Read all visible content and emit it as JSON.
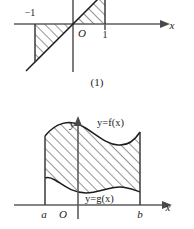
{
  "document": {
    "type": "math-figure-panel",
    "background_color": "#ffffff",
    "ink_color": "#1a1a1a"
  },
  "figures": [
    {
      "id": "figure-1",
      "caption": "(1)",
      "description": "Line y=x with two hatched triangular regions between the line and the x-axis",
      "axes": {
        "x_label": "x",
        "y_label": "",
        "origin_label": "O"
      },
      "tick_labels": [
        {
          "name": "neg-one",
          "text": "−1"
        },
        {
          "name": "one",
          "text": "1"
        }
      ],
      "regions": [
        {
          "name": "left-region",
          "hatched": true,
          "span": "from −1 to 0, below x-axis"
        },
        {
          "name": "right-region",
          "hatched": true,
          "span": "from 0 to 1, above x-axis"
        }
      ]
    },
    {
      "id": "figure-3",
      "caption": "(3)",
      "description": "Region bounded above by y=f(x), below by y=g(x), between x=a and x=b",
      "axes": {
        "x_label": "x",
        "y_label": "y",
        "origin_label": "O"
      },
      "tick_labels": [
        {
          "name": "lower-limit",
          "text": "a"
        },
        {
          "name": "upper-limit",
          "text": "b"
        }
      ],
      "curve_labels": [
        {
          "name": "upper-curve-label",
          "text": "y=f(x)"
        },
        {
          "name": "lower-curve-label",
          "text": "y=g(x)"
        }
      ],
      "regions": [
        {
          "name": "between-curves-region",
          "hatched": true,
          "span": "from a to b, between g(x) and f(x)"
        }
      ]
    }
  ]
}
